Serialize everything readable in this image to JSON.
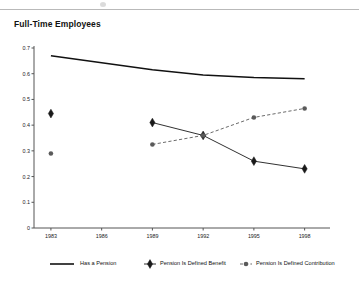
{
  "title": "Full-Time Employees",
  "chart_data": {
    "type": "line",
    "title": "Full-Time Employees",
    "xlabel": "",
    "ylabel": "",
    "x": [
      1983,
      1989,
      1992,
      1995,
      1998
    ],
    "categories": [
      "1983",
      "1986",
      "1989",
      "1992",
      "1995",
      "1998"
    ],
    "xtick_labels": [
      "1983",
      "1986",
      "1989",
      "1992",
      "1995",
      "1998"
    ],
    "xtick_values": [
      1983,
      1986,
      1989,
      1992,
      1995,
      1998
    ],
    "ytick_labels": [
      "0",
      "0.1",
      "0.2",
      "0.3",
      "0.4",
      "0.5",
      "0.6",
      "0.7"
    ],
    "ytick_values": [
      0,
      0.1,
      0.2,
      0.3,
      0.4,
      0.5,
      0.6,
      0.7
    ],
    "xlim": [
      1982,
      1999.5
    ],
    "ylim": [
      0,
      0.7
    ],
    "grid": false,
    "legend_position": "bottom",
    "series": [
      {
        "name": "Has a Pension",
        "style": "solid",
        "marker": "none",
        "color": "#111111",
        "x": [
          1983,
          1989,
          1992,
          1995,
          1998
        ],
        "values": [
          0.67,
          0.615,
          0.595,
          0.585,
          0.58
        ]
      },
      {
        "name": "Pension Is Defined Benefit",
        "style": "solid",
        "marker": "diamond",
        "color": "#1a1a1a",
        "x": [
          1983,
          1989,
          1992,
          1995,
          1998
        ],
        "values": [
          0.445,
          0.41,
          0.36,
          0.26,
          0.23
        ],
        "connected_from": 1989
      },
      {
        "name": "Pension Is Defined Contribution",
        "style": "dashed",
        "marker": "circle",
        "color": "#5a5a5a",
        "x": [
          1983,
          1989,
          1992,
          1995,
          1998
        ],
        "values": [
          0.29,
          0.325,
          0.36,
          0.43,
          0.465
        ],
        "connected_from": 1989
      }
    ]
  },
  "legend": {
    "items": [
      {
        "label": "Has a Pension",
        "marker": "line-solid"
      },
      {
        "label": "Pension Is Defined Benefit",
        "marker": "diamond-solid"
      },
      {
        "label": "Pension Is Defined Contribution",
        "marker": "circle-dashed"
      }
    ]
  }
}
